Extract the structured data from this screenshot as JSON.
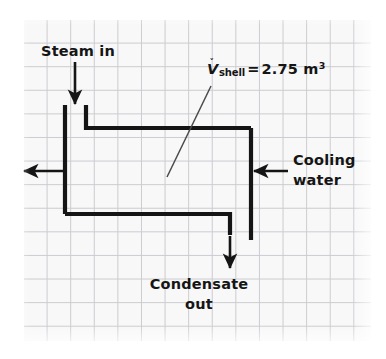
{
  "figure": {
    "type": "process-flow-diagram",
    "background_color": "#ffffff",
    "paper_color": "#f8f8f8",
    "grid_color": "#c9c9cf",
    "ink_color": "#151515"
  },
  "labels": {
    "steam_in": "Steam in",
    "cooling_water_line1": "Cooling",
    "cooling_water_line2": "water",
    "condensate_line1": "Condensate",
    "condensate_line2": "out",
    "volume": {
      "symbol": "V",
      "symbol_mark": "˅",
      "subscript": "shell",
      "equals": "=",
      "value": "2.75",
      "unit": "m",
      "unit_exponent": "3",
      "full_text": "V_shell = 2.75 m^3"
    }
  },
  "streams": [
    {
      "name": "steam-in",
      "direction": "down",
      "label": "Steam in"
    },
    {
      "name": "cooling-water-in",
      "direction": "left",
      "label": "Cooling water"
    },
    {
      "name": "cooling-water-out",
      "direction": "left",
      "label": ""
    },
    {
      "name": "condensate-out",
      "direction": "down",
      "label": "Condensate out"
    }
  ]
}
